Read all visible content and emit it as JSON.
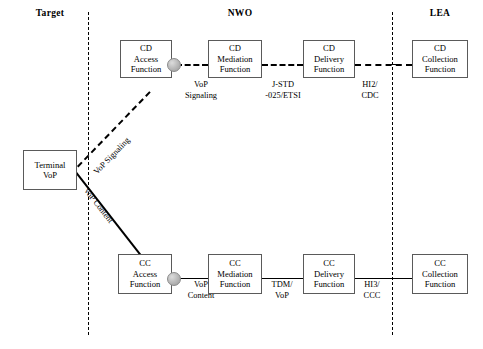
{
  "diagram": {
    "columns": [
      {
        "label": "Target"
      },
      {
        "label": "NWO"
      },
      {
        "label": "LEA"
      }
    ],
    "nodes": {
      "terminal": {
        "line1": "Terminal",
        "line2": "VoP"
      },
      "cd_access": {
        "line1": "CD",
        "line2": "Access",
        "line3": "Function"
      },
      "cd_mediation": {
        "line1": "CD",
        "line2": "Mediation",
        "line3": "Function"
      },
      "cd_delivery": {
        "line1": "CD",
        "line2": "Delivery",
        "line3": "Function"
      },
      "cd_collection": {
        "line1": "CD",
        "line2": "Collection",
        "line3": "Function"
      },
      "cc_access": {
        "line1": "CC",
        "line2": "Access",
        "line3": "Function"
      },
      "cc_mediation": {
        "line1": "CC",
        "line2": "Mediation",
        "line3": "Function"
      },
      "cc_delivery": {
        "line1": "CC",
        "line2": "Delivery",
        "line3": "Function"
      },
      "cc_collection": {
        "line1": "CC",
        "line2": "Collection",
        "line3": "Function"
      }
    },
    "edge_labels": {
      "vop_signaling_top": {
        "line1": "VoP",
        "line2": "Signaling"
      },
      "jstd_etsi": {
        "line1": "J-STD",
        "line2": "-025/ETSI"
      },
      "hi2_cdc": {
        "line1": "HI2/",
        "line2": "CDC"
      },
      "vop_content_bottom": {
        "line1": "VoP",
        "line2": "Content"
      },
      "tdm_vop": {
        "line1": "TDM/",
        "line2": "VoP"
      },
      "hi3_ccc": {
        "line1": "HI3/",
        "line2": "CCC"
      }
    },
    "trunk_labels": {
      "vop_signaling": "VoP Signaling",
      "vop_content": "VoP Content"
    }
  }
}
